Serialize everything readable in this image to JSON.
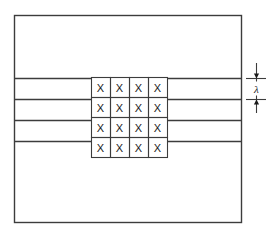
{
  "figure": {
    "background_color": "#ffffff",
    "line_color": "#3c3c3c",
    "cell_border_color": "#3c3c3c",
    "text_color": "#1a1a1a"
  },
  "outer_box": {
    "name": "medium-boundary",
    "x": 14,
    "y": 15,
    "width": 227,
    "height": 207
  },
  "layer_lines": {
    "count": 4,
    "y_positions": [
      78,
      99,
      120,
      141
    ],
    "x_start": 14,
    "x_end": 241
  },
  "grid": {
    "rows": 4,
    "cols": 4,
    "x": 91,
    "y": 77,
    "cell_width": 19,
    "cell_height": 20,
    "cells": [
      [
        "X",
        "X",
        "X",
        "X"
      ],
      [
        "X",
        "X",
        "X",
        "X"
      ],
      [
        "X",
        "X",
        "X",
        "X"
      ],
      [
        "X",
        "X",
        "X",
        "X"
      ]
    ]
  },
  "dimension": {
    "label": "λ",
    "label_plain": "lambda",
    "axis_x": 256,
    "top_y": 78,
    "bottom_y": 99,
    "extension_top_y": 63,
    "extension_bottom_y": 113,
    "tick_x_start": 246,
    "tick_x_end": 266
  }
}
